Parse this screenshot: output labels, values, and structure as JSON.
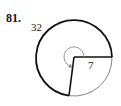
{
  "problem": {
    "number": "81."
  },
  "figure": {
    "arc_length_label": "32",
    "radius_label": "7",
    "colors": {
      "major_arc": "#111111",
      "minor_arc": "#777777",
      "angle_arrow": "#888888",
      "radii": "#111111"
    }
  }
}
